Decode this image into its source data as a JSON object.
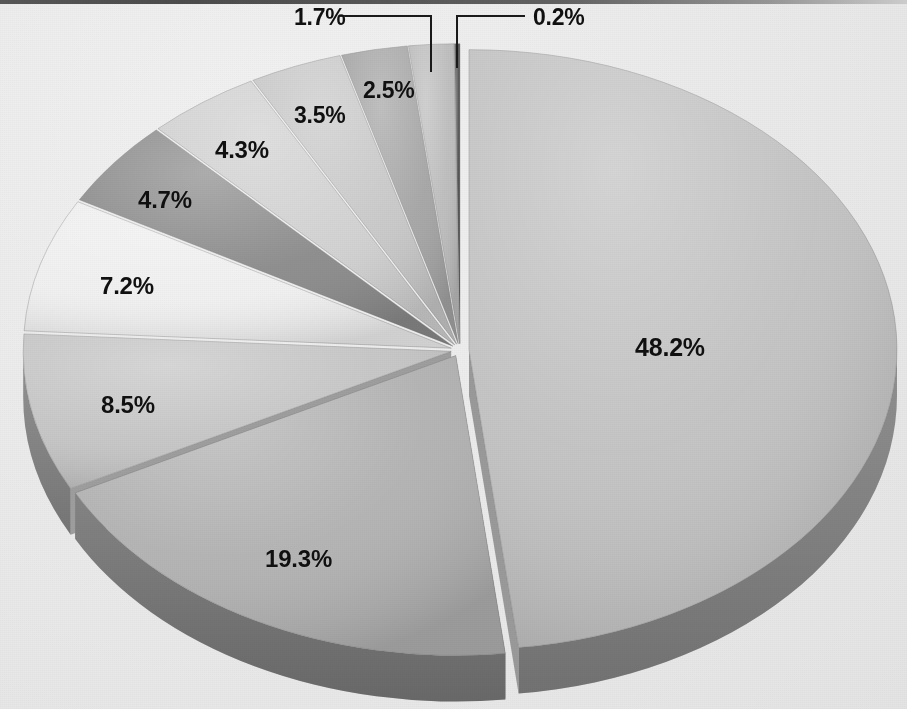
{
  "chart": {
    "title": "",
    "background_color": "#eaeaea"
  },
  "chart_data": {
    "type": "pie",
    "title": "",
    "subtitle": "",
    "xlabel": "",
    "ylabel": "",
    "grid": false,
    "legend": "none",
    "style": "3d-exploded-pie",
    "units": "percent",
    "total": 100.1,
    "categories": [
      "48.2%",
      "19.3%",
      "8.5%",
      "7.2%",
      "4.7%",
      "4.3%",
      "3.5%",
      "2.5%",
      "1.7%",
      "0.2%"
    ],
    "values": [
      48.2,
      19.3,
      8.5,
      7.2,
      4.7,
      4.3,
      3.5,
      2.5,
      1.7,
      0.2
    ],
    "slices": [
      {
        "label": "48.2%",
        "value": 48.2,
        "color": "#c3c3c3",
        "side_color": "#9a9a9a",
        "leader": false
      },
      {
        "label": "19.3%",
        "value": 19.3,
        "color": "#b2b2b2",
        "side_color": "#8d8d8d",
        "leader": false
      },
      {
        "label": "8.5%",
        "value": 8.5,
        "color": "#c6c6c6",
        "side_color": "#9e9e9e",
        "leader": false
      },
      {
        "label": "7.2%",
        "value": 7.2,
        "color": "#f0f0f0",
        "side_color": "#c2c2c2",
        "leader": false
      },
      {
        "label": "4.7%",
        "value": 4.7,
        "color": "#8b8b8b",
        "side_color": "#6e6e6e",
        "leader": false
      },
      {
        "label": "4.3%",
        "value": 4.3,
        "color": "#d2d2d2",
        "side_color": "#a8a8a8",
        "leader": false
      },
      {
        "label": "3.5%",
        "value": 3.5,
        "color": "#c9c9c9",
        "side_color": "#a0a0a0",
        "leader": false
      },
      {
        "label": "2.5%",
        "value": 2.5,
        "color": "#a5a5a5",
        "side_color": "#828282",
        "leader": false
      },
      {
        "label": "1.7%",
        "value": 1.7,
        "color": "#bdbdbd",
        "side_color": "#979797",
        "leader": true
      },
      {
        "label": "0.2%",
        "value": 0.2,
        "color": "#4f4f4f",
        "side_color": "#3e3e3e",
        "leader": true
      }
    ],
    "leader_lines": [
      {
        "label": "1.7%",
        "from_x": 340,
        "to_x": 431,
        "y": 16,
        "drop_to_y": 72
      },
      {
        "label": "0.2%",
        "from_x": 525,
        "to_x": 457,
        "y": 16,
        "drop_to_y": 68
      }
    ]
  },
  "labels": {
    "s_48_2": "48.2%",
    "s_19_3": "19.3%",
    "s_8_5": "8.5%",
    "s_7_2": "7.2%",
    "s_4_7": "4.7%",
    "s_4_3": "4.3%",
    "s_3_5": "3.5%",
    "s_2_5": "2.5%",
    "s_1_7": "1.7%",
    "s_0_2": "0.2%"
  }
}
